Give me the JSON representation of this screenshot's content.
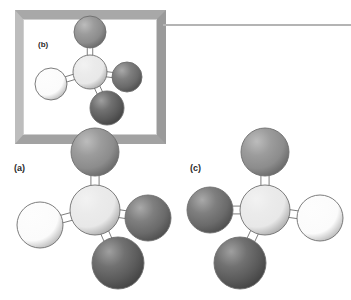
{
  "figure": {
    "background_color": "#ffffff",
    "width": 351,
    "height": 300
  },
  "inset_frame": {
    "name": "inset-box",
    "x": 15,
    "y": 10,
    "width": 151,
    "height": 134,
    "border_color": "#a8a8a8",
    "fill_color": "#ffffff"
  },
  "leader_line": {
    "name": "leader-line",
    "x": 163,
    "y": 24,
    "width": 188,
    "color": "#b4b4b4"
  },
  "palette": {
    "central_atom": "#e8e8e8",
    "white_atom": "#fbfbfb",
    "medium_atom": "#8c8c8c",
    "dark_atom": "#6a6a6a",
    "darkest_atom": "#5a5a5a",
    "outline": "#6e6e6e",
    "bond": "#ffffff",
    "bond_outline": "#6e6e6e"
  },
  "panels": [
    {
      "id": "a",
      "label": "(a)",
      "label_x": 14,
      "label_y": 163,
      "font_size": 9,
      "description": "Tetrahedral molecule, reference configuration"
    },
    {
      "id": "b",
      "label": "(b)",
      "label_x": 38,
      "label_y": 40,
      "font_size": 8,
      "description": "Inset duplicate of configuration (a) inside framed box"
    },
    {
      "id": "c",
      "label": "(c)",
      "label_x": 190,
      "label_y": 163,
      "font_size": 9,
      "description": "Mirror image enantiomer of configuration (a)"
    }
  ],
  "molecules": [
    {
      "id": "molecule-a",
      "panel": "a",
      "origin_x": 0,
      "origin_y": 130,
      "center": {
        "x": 95,
        "y": 80,
        "r": 25,
        "color": "#e8e8e8",
        "name": "central-atom"
      },
      "atoms": [
        {
          "name": "atom-top",
          "x": 95,
          "y": 22,
          "r": 24,
          "color": "#8c8c8c"
        },
        {
          "name": "atom-left-white",
          "x": 40,
          "y": 95,
          "r": 23,
          "color": "#fbfbfb"
        },
        {
          "name": "atom-right-dark",
          "x": 148,
          "y": 88,
          "r": 23,
          "color": "#6a6a6a"
        },
        {
          "name": "atom-bottom-dark",
          "x": 118,
          "y": 133,
          "r": 26,
          "color": "#5a5a5a"
        }
      ]
    },
    {
      "id": "molecule-b",
      "panel": "b",
      "origin_x": 24,
      "origin_y": 16,
      "center": {
        "x": 66,
        "y": 56,
        "r": 17,
        "color": "#e8e8e8",
        "name": "central-atom"
      },
      "atoms": [
        {
          "name": "atom-top",
          "x": 66,
          "y": 16,
          "r": 16,
          "color": "#8c8c8c"
        },
        {
          "name": "atom-left-white",
          "x": 27,
          "y": 68,
          "r": 16,
          "color": "#fbfbfb"
        },
        {
          "name": "atom-right-dark",
          "x": 103,
          "y": 61,
          "r": 15,
          "color": "#6a6a6a"
        },
        {
          "name": "atom-bottom-dark",
          "x": 83,
          "y": 92,
          "r": 17,
          "color": "#5a5a5a"
        }
      ]
    },
    {
      "id": "molecule-c",
      "panel": "c",
      "origin_x": 180,
      "origin_y": 120,
      "center": {
        "x": 85,
        "y": 90,
        "r": 25,
        "color": "#e8e8e8",
        "name": "central-atom"
      },
      "atoms": [
        {
          "name": "atom-top",
          "x": 85,
          "y": 32,
          "r": 24,
          "color": "#8c8c8c"
        },
        {
          "name": "atom-right-white",
          "x": 140,
          "y": 98,
          "r": 23,
          "color": "#fbfbfb"
        },
        {
          "name": "atom-left-dark",
          "x": 30,
          "y": 90,
          "r": 23,
          "color": "#6a6a6a"
        },
        {
          "name": "atom-bottom-dark",
          "x": 60,
          "y": 143,
          "r": 26,
          "color": "#5a5a5a"
        }
      ]
    }
  ]
}
